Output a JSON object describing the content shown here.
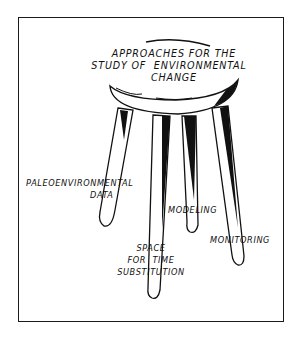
{
  "diagram": {
    "type": "stool-metaphor",
    "title_lines": [
      "APPROACHES FOR THE",
      "STUDY OF  ENVIRONMENTAL",
      "CHANGE"
    ],
    "legs": [
      {
        "label_lines": [
          "PALEOENVIRONMENTAL",
          "DATA"
        ]
      },
      {
        "label_lines": [
          "SPACE",
          "FOR  TIME",
          "SUBSTITUTION"
        ]
      },
      {
        "label_lines": [
          "MODELING"
        ]
      },
      {
        "label_lines": [
          "MONITORING"
        ]
      }
    ],
    "colors": {
      "ink": "#111111",
      "background": "#ffffff"
    }
  }
}
